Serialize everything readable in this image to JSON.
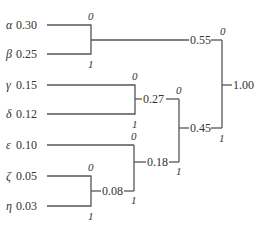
{
  "leaves": [
    {
      "symbol": "α",
      "prob": "0.30",
      "y": 25
    },
    {
      "symbol": "β",
      "prob": "0.25",
      "y": 54
    },
    {
      "symbol": "γ",
      "prob": "0.15",
      "y": 85
    },
    {
      "symbol": "δ",
      "prob": "0.12",
      "y": 114
    },
    {
      "symbol": "ε",
      "prob": "0.10",
      "y": 145
    },
    {
      "symbol": "ζ",
      "prob": "0.05",
      "y": 176
    },
    {
      "symbol": "η",
      "prob": "0.03",
      "y": 206
    }
  ],
  "nodes": {
    "n055": {
      "label": "0.55"
    },
    "n027": {
      "label": "0.27"
    },
    "n018": {
      "label": "0.18"
    },
    "n008": {
      "label": "0.08"
    },
    "n045": {
      "label": "0.45"
    },
    "root": {
      "label": "1.00"
    }
  },
  "bits": {
    "zero": "0",
    "one": "1"
  }
}
